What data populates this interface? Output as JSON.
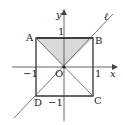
{
  "diagram": {
    "type": "coordinate-geometry",
    "axes": {
      "x_label": "x",
      "y_label": "y",
      "origin_label": "O",
      "ticks": {
        "x_pos": "1",
        "x_neg": "−1",
        "y_pos": "1",
        "y_neg": "−1"
      }
    },
    "square": {
      "vertices": [
        {
          "label": "A",
          "x": -1,
          "y": 1
        },
        {
          "label": "B",
          "x": 1,
          "y": 1
        },
        {
          "label": "C",
          "x": 1,
          "y": -1
        },
        {
          "label": "D",
          "x": -1,
          "y": -1
        }
      ]
    },
    "shaded_region": {
      "shape": "triangle",
      "vertices": [
        "A",
        "B",
        "O"
      ],
      "color": "#d9d9d9"
    },
    "line": {
      "label": "ℓ",
      "equation": "y = x"
    },
    "diagonals": [
      "AC",
      "BD"
    ],
    "colors": {
      "stroke": "#333333",
      "axis": "#555555",
      "background": "#ffffff"
    }
  }
}
